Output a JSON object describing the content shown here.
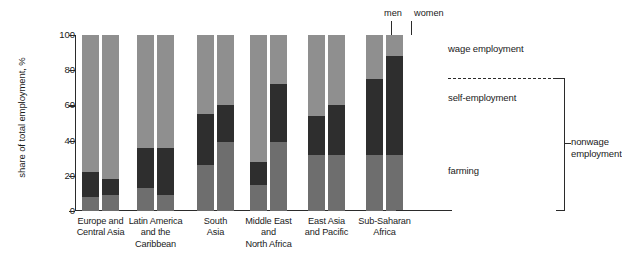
{
  "chart_data": {
    "type": "bar",
    "subtype": "stacked-grouped-column",
    "title": "",
    "xlabel": "",
    "ylabel": "share of total employment, %",
    "ylim": [
      0,
      100
    ],
    "yticks": [
      0,
      20,
      40,
      60,
      80,
      100
    ],
    "grid": false,
    "legend_position": "right",
    "stack_order": [
      "farming",
      "self-employment",
      "wage employment"
    ],
    "categories": [
      "Europe and Central Asia",
      "Latin America and the Caribbean",
      "South Asia",
      "Middle East and North Africa",
      "East Asia and Pacific",
      "Sub-Saharan Africa"
    ],
    "subgroups": [
      "men",
      "women"
    ],
    "series": [
      {
        "name": "farming",
        "color": "#6e6e6e",
        "values_men": [
          8,
          13,
          26,
          15,
          32,
          32
        ],
        "values_women": [
          9,
          9,
          39,
          39,
          32,
          32
        ]
      },
      {
        "name": "self-employment",
        "color": "#2e2e2e",
        "values_men": [
          14,
          23,
          29,
          13,
          22,
          43
        ],
        "values_women": [
          9,
          27,
          21,
          33,
          28,
          56
        ]
      },
      {
        "name": "wage employment",
        "color": "#8f8f8f",
        "values_men": [
          78,
          64,
          45,
          72,
          46,
          25
        ],
        "values_women": [
          82,
          64,
          40,
          28,
          40,
          12
        ]
      }
    ],
    "cumulative_tops": {
      "men": [
        [
          8,
          22,
          100
        ],
        [
          13,
          36,
          100
        ],
        [
          26,
          55,
          100
        ],
        [
          15,
          28,
          100
        ],
        [
          32,
          54,
          100
        ],
        [
          32,
          75,
          100
        ]
      ],
      "women": [
        [
          9,
          18,
          100
        ],
        [
          9,
          36,
          100
        ],
        [
          39,
          60,
          100
        ],
        [
          39,
          72,
          100
        ],
        [
          32,
          60,
          100
        ],
        [
          32,
          88,
          100
        ]
      ]
    },
    "annotations": [
      "men",
      "women",
      "wage employment",
      "self-employment",
      "farming",
      "nonwage employment"
    ]
  },
  "axis": {
    "y_title": "share of total employment, %",
    "y_ticks": [
      "100",
      "80",
      "60",
      "40",
      "20",
      "0"
    ]
  },
  "groups": [
    {
      "id": "europe-central-asia",
      "lines": [
        "Europe and",
        "Central Asia"
      ]
    },
    {
      "id": "latin-america-caribbean",
      "lines": [
        "Latin America",
        "and the",
        "Caribbean"
      ]
    },
    {
      "id": "south-asia",
      "lines": [
        "South",
        "Asia"
      ]
    },
    {
      "id": "middle-east-north-africa",
      "lines": [
        "Middle East",
        "and",
        "North Africa"
      ]
    },
    {
      "id": "east-asia-pacific",
      "lines": [
        "East Asia",
        "and Pacific"
      ]
    },
    {
      "id": "sub-saharan-africa",
      "lines": [
        "Sub-Saharan",
        "Africa"
      ]
    }
  ],
  "callouts": {
    "men": "men",
    "women": "women"
  },
  "legend": {
    "wage": "wage employment",
    "self": "self-employment",
    "farming": "farming",
    "nonwage_line1": "nonwage",
    "nonwage_line2": "employment"
  },
  "colors": {
    "wage_employment": "#8f8f8f",
    "self_employment": "#2e2e2e",
    "farming": "#6e6e6e",
    "axis": "#2b2b2b",
    "text": "#1a1a1a",
    "background": "#ffffff"
  }
}
